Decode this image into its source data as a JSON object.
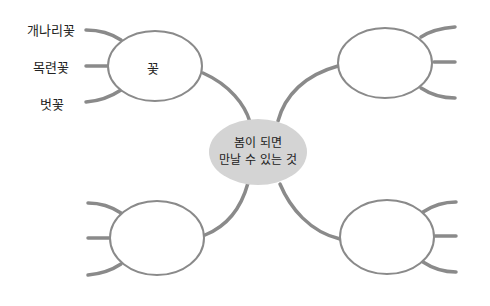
{
  "center": {
    "line1": "봄이 되면",
    "line2": "만날 수 있는 것",
    "fill": "#d4d4d4"
  },
  "nodes": {
    "top_left": {
      "label": "꽃",
      "leaves": [
        "개나리꽃",
        "목련꽃",
        "벗꽃"
      ]
    },
    "top_right": {
      "label": "",
      "leaves": [
        "",
        "",
        ""
      ]
    },
    "bottom_left": {
      "label": "",
      "leaves": [
        "",
        "",
        ""
      ]
    },
    "bottom_right": {
      "label": "",
      "leaves": [
        "",
        "",
        ""
      ]
    }
  },
  "colors": {
    "line": "#8a8a8a",
    "text": "#222222"
  }
}
